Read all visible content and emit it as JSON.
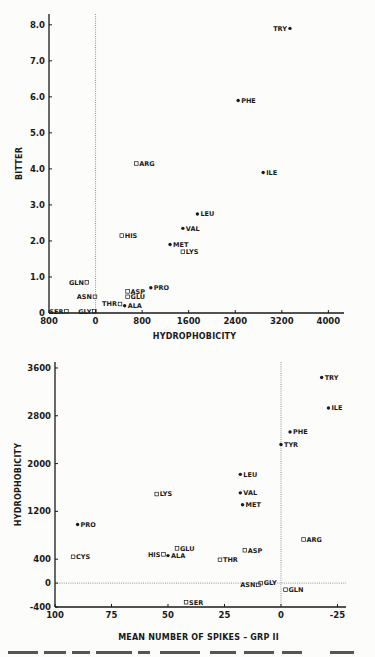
{
  "chart_data": [
    {
      "type": "scatter",
      "title": "",
      "xlabel": "HYDROPHOBICITY",
      "ylabel": "BITTER",
      "xlim": [
        -800,
        4200
      ],
      "ylim": [
        0,
        8.3
      ],
      "x_ticks": [
        -800,
        0,
        800,
        1600,
        2400,
        3200,
        4000
      ],
      "x_tick_labels": [
        "800",
        "0",
        "800",
        "1600",
        "2400",
        "3200",
        "4000"
      ],
      "y_ticks": [
        0,
        1,
        2,
        3,
        4,
        5,
        6,
        7,
        8
      ],
      "y_tick_labels": [
        "0",
        "1.0",
        "2.0",
        "3.0",
        "4.0",
        "5.0",
        "6.0",
        "7.0",
        "8.0"
      ],
      "grid": false,
      "reference_lines": [
        {
          "orientation": "vertical",
          "x": 0,
          "style": "dotted"
        }
      ],
      "legend": null,
      "points": [
        {
          "label": "TRY",
          "x": 3340,
          "y": 7.9,
          "marker": "filled",
          "label_side": "left"
        },
        {
          "label": "PHE",
          "x": 2450,
          "y": 5.9,
          "marker": "filled",
          "label_side": "right"
        },
        {
          "label": "ILE",
          "x": 2880,
          "y": 3.9,
          "marker": "filled",
          "label_side": "right"
        },
        {
          "label": "ARG",
          "x": 700,
          "y": 4.15,
          "marker": "open",
          "label_side": "right"
        },
        {
          "label": "LEU",
          "x": 1750,
          "y": 2.75,
          "marker": "filled",
          "label_side": "right"
        },
        {
          "label": "VAL",
          "x": 1500,
          "y": 2.35,
          "marker": "filled",
          "label_side": "right"
        },
        {
          "label": "HIS",
          "x": 450,
          "y": 2.15,
          "marker": "open",
          "label_side": "right"
        },
        {
          "label": "MET",
          "x": 1280,
          "y": 1.9,
          "marker": "filled",
          "label_side": "right"
        },
        {
          "label": "LYS",
          "x": 1500,
          "y": 1.7,
          "marker": "open",
          "label_side": "right"
        },
        {
          "label": "PRO",
          "x": 950,
          "y": 0.7,
          "marker": "filled",
          "label_side": "right"
        },
        {
          "label": "GLN",
          "x": -150,
          "y": 0.85,
          "marker": "open",
          "label_side": "left"
        },
        {
          "label": "ASP",
          "x": 550,
          "y": 0.6,
          "marker": "open",
          "label_side": "right"
        },
        {
          "label": "GLU",
          "x": 550,
          "y": 0.45,
          "marker": "open",
          "label_side": "right"
        },
        {
          "label": "ASN",
          "x": -10,
          "y": 0.45,
          "marker": "open",
          "label_side": "left"
        },
        {
          "label": "THR",
          "x": 420,
          "y": 0.25,
          "marker": "open",
          "label_side": "left"
        },
        {
          "label": "ALA",
          "x": 500,
          "y": 0.2,
          "marker": "filled",
          "label_side": "right"
        },
        {
          "label": "SER",
          "x": -500,
          "y": 0.05,
          "marker": "open",
          "label_side": "left"
        },
        {
          "label": "GLY",
          "x": -20,
          "y": 0.05,
          "marker": "open",
          "label_side": "left"
        }
      ]
    },
    {
      "type": "scatter",
      "title": "",
      "xlabel": "MEAN NUMBER OF SPIKES – GRP II",
      "ylabel": "HYDROPHOBICITY",
      "xlim": [
        100,
        -27
      ],
      "x_inverted": true,
      "ylim": [
        -400,
        3700
      ],
      "x_ticks": [
        100,
        75,
        50,
        25,
        0,
        -25
      ],
      "x_tick_labels": [
        "100",
        "75",
        "50",
        "25",
        "0",
        "-25"
      ],
      "y_ticks": [
        -400,
        0,
        400,
        1200,
        2000,
        2800,
        3600
      ],
      "y_tick_labels": [
        "-400",
        "0",
        "400",
        "1200",
        "2000",
        "2800",
        "3600"
      ],
      "grid": false,
      "reference_lines": [
        {
          "orientation": "vertical",
          "x": 0,
          "style": "dotted"
        },
        {
          "orientation": "horizontal",
          "y": 0,
          "style": "dotted"
        }
      ],
      "legend": null,
      "points": [
        {
          "label": "TRY",
          "x": -18,
          "y": 3440,
          "marker": "filled",
          "label_side": "right"
        },
        {
          "label": "ILE",
          "x": -21,
          "y": 2930,
          "marker": "filled",
          "label_side": "right"
        },
        {
          "label": "PHE",
          "x": -4,
          "y": 2530,
          "marker": "filled",
          "label_side": "right"
        },
        {
          "label": "TYR",
          "x": 0,
          "y": 2320,
          "marker": "filled",
          "label_side": "right"
        },
        {
          "label": "LEU",
          "x": 18,
          "y": 1820,
          "marker": "filled",
          "label_side": "right"
        },
        {
          "label": "VAL",
          "x": 18,
          "y": 1510,
          "marker": "filled",
          "label_side": "right"
        },
        {
          "label": "MET",
          "x": 17,
          "y": 1310,
          "marker": "filled",
          "label_side": "right"
        },
        {
          "label": "LYS",
          "x": 55,
          "y": 1490,
          "marker": "open",
          "label_side": "right"
        },
        {
          "label": "PRO",
          "x": 90,
          "y": 980,
          "marker": "filled",
          "label_side": "right"
        },
        {
          "label": "ARG",
          "x": -10,
          "y": 730,
          "marker": "open",
          "label_side": "right"
        },
        {
          "label": "GLU",
          "x": 46,
          "y": 580,
          "marker": "open",
          "label_side": "right"
        },
        {
          "label": "ASP",
          "x": 16,
          "y": 550,
          "marker": "open",
          "label_side": "right"
        },
        {
          "label": "HIS",
          "x": 52,
          "y": 480,
          "marker": "open",
          "label_side": "left"
        },
        {
          "label": "ALA",
          "x": 50,
          "y": 460,
          "marker": "filled",
          "label_side": "right"
        },
        {
          "label": "CYS",
          "x": 92,
          "y": 440,
          "marker": "open",
          "label_side": "right"
        },
        {
          "label": "THR",
          "x": 27,
          "y": 390,
          "marker": "open",
          "label_side": "right"
        },
        {
          "label": "ASN",
          "x": 10,
          "y": -30,
          "marker": "open",
          "label_side": "left"
        },
        {
          "label": "GLY",
          "x": 9,
          "y": 0,
          "marker": "open",
          "label_side": "right"
        },
        {
          "label": "GLN",
          "x": -2,
          "y": -110,
          "marker": "open",
          "label_side": "right"
        },
        {
          "label": "SER",
          "x": 42,
          "y": -320,
          "marker": "open",
          "label_side": "right"
        }
      ]
    }
  ],
  "figure": {
    "top_chart": {
      "ylabel": "BITTER",
      "xlabel": "HYDROPHOBICITY",
      "x_tick_labels": [
        "800",
        "0",
        "800",
        "1600",
        "2400",
        "3200",
        "4000"
      ],
      "y_tick_labels": [
        "8.0",
        "7.0",
        "6.0",
        "5.0",
        "4.0",
        "3.0",
        "2.0",
        "1.0",
        "0"
      ]
    },
    "bottom_chart": {
      "ylabel": "HYDROPHOBICITY",
      "xlabel": "MEAN NUMBER OF SPIKES – GRP II",
      "x_tick_labels": [
        "100",
        "75",
        "50",
        "25",
        "0",
        "-25"
      ],
      "y_tick_labels": [
        "3600",
        "2800",
        "2000",
        "1200",
        "400",
        "0",
        "-400"
      ]
    },
    "colors": {
      "ink": "#1a1a1a",
      "paper": "#fcfcfa",
      "dotted": "#777777"
    }
  }
}
